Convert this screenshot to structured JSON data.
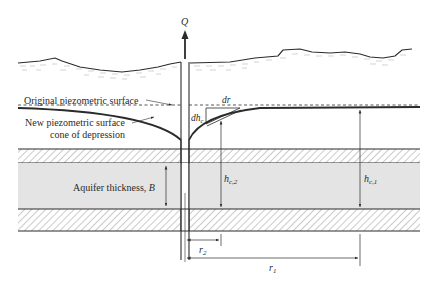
{
  "diagram": {
    "labels": {
      "discharge": "Q",
      "original_surface": "Original piezometric surface",
      "new_surface_line1": "New piezometric surface",
      "new_surface_line2": "cone of depression",
      "dr": "dr",
      "dh": "dh",
      "dh_sub": "c",
      "aquifer": "Aquifer thickness, ",
      "aquifer_var": "B",
      "hc2_main": "h",
      "hc2_sub": "c,2",
      "hc1_main": "h",
      "hc1_sub": "c,1",
      "r2_main": "r",
      "r2_sub": "2",
      "r1_main": "r",
      "r1_sub": "1"
    },
    "colors": {
      "line": "#2b2b2b",
      "aquifer_fill": "#e4e4e4",
      "hatch": "#8a8a8a",
      "soil_texture": "#b5b5b5"
    }
  }
}
